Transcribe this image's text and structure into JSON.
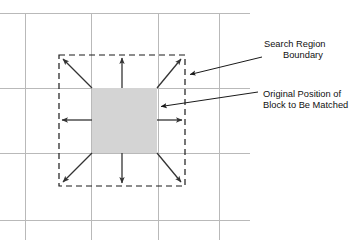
{
  "figure": {
    "background_color": "#ffffff"
  },
  "colors": {
    "grid": "#b9b9b9",
    "block_fill": "#d4d4d4",
    "boundary_stroke": "#1a1a1a",
    "arrow_stroke": "#333333",
    "text": "#111111"
  },
  "grid": {
    "vertical_x": [
      25,
      91,
      158,
      219
    ],
    "horizontal_y": [
      13,
      88,
      153,
      220
    ]
  },
  "search_region": {
    "label_line_1": "Search Region",
    "label_line_2": "Boundary",
    "rect": {
      "x": 59,
      "y": 55,
      "width": 126,
      "height": 131
    },
    "stroke_style": "dashed"
  },
  "block": {
    "label_line_1": "Original Position of",
    "label_line_2": "Block to Be Matched",
    "rect": {
      "x": 92,
      "y": 88,
      "width": 65,
      "height": 65
    },
    "fill_style": "solid-gray"
  },
  "motion_arrows": [
    {
      "name": "arrow-up",
      "x1": 122,
      "y1": 88,
      "x2": 122,
      "y2": 56
    },
    {
      "name": "arrow-down",
      "x1": 122,
      "y1": 153,
      "x2": 122,
      "y2": 185
    },
    {
      "name": "arrow-left",
      "x1": 92,
      "y1": 120,
      "x2": 60,
      "y2": 120
    },
    {
      "name": "arrow-right",
      "x1": 157,
      "y1": 120,
      "x2": 184,
      "y2": 120
    },
    {
      "name": "arrow-up-left",
      "x1": 92,
      "y1": 88,
      "x2": 61,
      "y2": 57
    },
    {
      "name": "arrow-up-right",
      "x1": 157,
      "y1": 88,
      "x2": 183,
      "y2": 57
    },
    {
      "name": "arrow-down-left",
      "x1": 92,
      "y1": 153,
      "x2": 61,
      "y2": 184
    },
    {
      "name": "arrow-down-right",
      "x1": 157,
      "y1": 153,
      "x2": 183,
      "y2": 184
    }
  ],
  "leaders": [
    {
      "name": "leader-search-region",
      "x1": 262,
      "y1": 57,
      "x2": 189,
      "y2": 75
    },
    {
      "name": "leader-block",
      "x1": 258,
      "y1": 92,
      "x2": 159,
      "y2": 107
    }
  ],
  "text_blocks": [
    {
      "name": "search-region-label",
      "x": 264,
      "y": 47,
      "line_height": 11
    },
    {
      "name": "block-label",
      "x": 263,
      "y": 97,
      "line_height": 11
    }
  ]
}
